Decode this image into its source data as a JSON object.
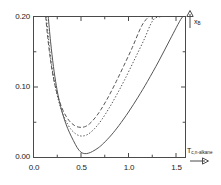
{
  "chart_data": {
    "type": "line",
    "title": "",
    "subtitle": "",
    "xlabel": "T_{c,n-alkane}",
    "ylabel": "x_B",
    "xlabel_display": "T",
    "xlabel_sub": "c,n-alkane",
    "ylabel_display": "x",
    "ylabel_sub": "B",
    "xlim": [
      0.0,
      1.6
    ],
    "ylim": [
      0.0,
      0.2
    ],
    "xticks": [
      0.0,
      0.5,
      1.0,
      1.5
    ],
    "xtick_labels": [
      "0.0",
      "0.5",
      "1.0",
      "1.5"
    ],
    "xminor_ticks": [
      0.25,
      0.75,
      1.25
    ],
    "yticks": [
      0.0,
      0.1,
      0.2
    ],
    "ytick_labels": [
      "0.00",
      "0.10",
      "0.20"
    ],
    "yminor_ticks": [
      0.05,
      0.15
    ],
    "grid": false,
    "legend": "none",
    "series": [
      {
        "name": "solid-curve",
        "style": "solid",
        "color": "#555555",
        "x": [
          0.155,
          0.18,
          0.21,
          0.24,
          0.27,
          0.3,
          0.34,
          0.38,
          0.42,
          0.46,
          0.5,
          0.54,
          0.58,
          0.62,
          0.68,
          0.74,
          0.82,
          0.9,
          1.0,
          1.1,
          1.2,
          1.32,
          1.44,
          1.56,
          1.6
        ],
        "y": [
          0.2,
          0.164,
          0.129,
          0.102,
          0.081,
          0.065,
          0.048,
          0.035,
          0.024,
          0.014,
          0.0075,
          0.0055,
          0.0062,
          0.0085,
          0.0135,
          0.0205,
          0.032,
          0.0455,
          0.0645,
          0.0855,
          0.108,
          0.137,
          0.168,
          0.198,
          0.2
        ]
      },
      {
        "name": "dotted-curve",
        "style": "dotted",
        "color": "#555555",
        "x": [
          0.135,
          0.16,
          0.19,
          0.22,
          0.25,
          0.28,
          0.32,
          0.36,
          0.4,
          0.44,
          0.48,
          0.52,
          0.56,
          0.6,
          0.66,
          0.72,
          0.8,
          0.88,
          0.96,
          1.06,
          1.16,
          1.26,
          1.36,
          1.42
        ],
        "y": [
          0.2,
          0.166,
          0.132,
          0.107,
          0.088,
          0.073,
          0.058,
          0.047,
          0.039,
          0.034,
          0.031,
          0.0305,
          0.032,
          0.0355,
          0.0435,
          0.054,
          0.071,
          0.09,
          0.1105,
          0.138,
          0.166,
          0.195,
          0.2,
          0.2
        ]
      },
      {
        "name": "dashed-curve",
        "style": "dashed",
        "color": "#555555",
        "x": [
          0.128,
          0.15,
          0.18,
          0.21,
          0.24,
          0.27,
          0.31,
          0.35,
          0.39,
          0.43,
          0.47,
          0.51,
          0.55,
          0.59,
          0.65,
          0.71,
          0.79,
          0.87,
          0.95,
          1.04,
          1.14,
          1.22,
          1.28
        ],
        "y": [
          0.2,
          0.17,
          0.137,
          0.113,
          0.095,
          0.081,
          0.067,
          0.057,
          0.05,
          0.0455,
          0.0432,
          0.0428,
          0.0442,
          0.0478,
          0.0565,
          0.068,
          0.0865,
          0.1075,
          0.13,
          0.156,
          0.187,
          0.2,
          0.2
        ]
      }
    ]
  },
  "annotations": {
    "y_axis_arrow": "arrow-up",
    "x_axis_arrow": "arrow-right"
  }
}
